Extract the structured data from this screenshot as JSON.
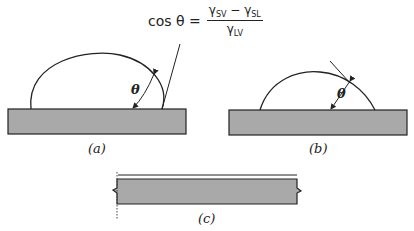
{
  "equation": {
    "lhs": "cos θ =",
    "numerator": {
      "a": "γ",
      "a_sub": "SV",
      "op": " − ",
      "b": "γ",
      "b_sub": "SL"
    },
    "denominator": {
      "c": "γ",
      "c_sub": "LV"
    }
  },
  "panels": {
    "a": {
      "caption": "(a)",
      "angle_label": "θ",
      "description": "Drop with contact angle greater than 90° on solid substrate"
    },
    "b": {
      "caption": "(b)",
      "angle_label": "θ",
      "description": "Drop with contact angle less than 90° on solid substrate"
    },
    "c": {
      "caption": "(c)",
      "description": "Thin liquid film spread over solid substrate (complete wetting)"
    }
  },
  "colors": {
    "substrate_fill": "#a9a9a9",
    "line": "#222222",
    "background": "#ffffff"
  }
}
